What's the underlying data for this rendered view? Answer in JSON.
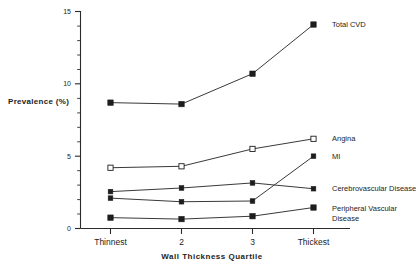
{
  "chart_data": {
    "type": "line",
    "title": "",
    "xlabel": "Wall  Thickness  Quartile",
    "ylabel": "Prevalence   (%)",
    "categories": [
      "Thinnest",
      "2",
      "3",
      "Thickest"
    ],
    "ylim": [
      0,
      15
    ],
    "yticks": [
      0,
      5,
      10,
      15
    ],
    "ytick_labels": [
      "0",
      "5",
      "10",
      "15"
    ],
    "yminor_step": 1,
    "grid": false,
    "legend_position": "right-inline-labels",
    "series": [
      {
        "name": "Total CVD",
        "marker": "filled-square",
        "values": [
          8.7,
          8.6,
          10.7,
          14.1
        ]
      },
      {
        "name": "Angina",
        "marker": "open-square",
        "values": [
          4.2,
          4.3,
          5.5,
          6.2
        ]
      },
      {
        "name": "MI",
        "marker": "filled-square",
        "values": [
          2.1,
          1.85,
          1.9,
          5.0
        ]
      },
      {
        "name": "Cerebrovascular Disease",
        "marker": "filled-square",
        "values": [
          2.55,
          2.8,
          3.15,
          2.75
        ]
      },
      {
        "name": "Peripheral Vascular Disease",
        "marker": "filled-square",
        "values": [
          0.75,
          0.65,
          0.85,
          1.45
        ]
      }
    ]
  },
  "labels": {
    "total_cvd": "Total CVD",
    "angina": "Angina",
    "mi": "MI",
    "cerebrovascular": "Cerebrovascular Disease",
    "pvd_line1": "Peripheral Vascular",
    "pvd_line2": "Disease"
  },
  "ytick_0": "0",
  "ytick_5": "5",
  "ytick_10": "10",
  "ytick_15": "15",
  "xtick_1": "Thinnest",
  "xtick_2": "2",
  "xtick_3": "3",
  "xtick_4": "Thickest",
  "axis_title_x": "Wall  Thickness  Quartile",
  "axis_title_y": "Prevalence   (%)",
  "colors": {
    "line": "#3a3a3a",
    "marker": "#1d1d1d",
    "axis": "#2b2b2b",
    "background": "#ffffff"
  }
}
